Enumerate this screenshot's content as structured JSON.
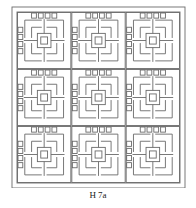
{
  "figure": {
    "caption": "H 7a",
    "colors": {
      "line": "#6a6a6a",
      "background": "#ffffff"
    },
    "frame": {
      "outer": [
        12,
        7,
        173,
        181
      ],
      "inner": [
        17,
        12,
        163,
        171
      ]
    },
    "grid": {
      "tiles_x": 3,
      "tiles_y": 3
    }
  }
}
